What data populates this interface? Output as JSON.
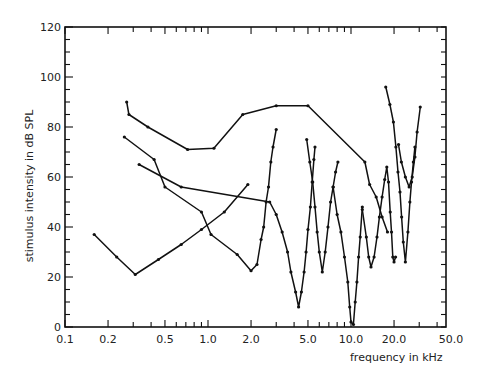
{
  "chart_data": {
    "type": "line",
    "title": "",
    "xlabel": "frequency in kHz",
    "ylabel": "stimulus intensity in dB SPL",
    "xscale": "log",
    "xlim": [
      0.1,
      50.0
    ],
    "ylim": [
      0,
      120
    ],
    "x_ticks": [
      0.1,
      0.2,
      0.5,
      1.0,
      2.0,
      5.0,
      10.0,
      20.0,
      50.0
    ],
    "x_tick_labels": [
      "0.1",
      "0.2",
      "0.5",
      "1.0",
      "2.0",
      "5.0",
      "10.0",
      "20.0",
      "50.0"
    ],
    "y_ticks": [
      0,
      20,
      40,
      60,
      80,
      100,
      120
    ],
    "y_tick_labels": [
      "0",
      "20",
      "40",
      "60",
      "80",
      "100",
      "120"
    ],
    "grid": false,
    "legend": null,
    "series": [
      {
        "name": "curve-1",
        "points": [
          [
            0.27,
            90
          ],
          [
            0.28,
            85
          ],
          [
            0.38,
            80
          ],
          [
            0.72,
            71
          ],
          [
            1.1,
            71.5
          ],
          [
            1.75,
            85
          ],
          [
            3.0,
            88.5
          ],
          [
            5.0,
            88.5
          ],
          [
            12.5,
            66
          ],
          [
            13.5,
            57
          ],
          [
            15.0,
            52
          ],
          [
            16.5,
            44
          ],
          [
            18.0,
            38
          ]
        ]
      },
      {
        "name": "curve-2",
        "points": [
          [
            0.26,
            76
          ],
          [
            0.42,
            67
          ],
          [
            0.5,
            56
          ],
          [
            0.9,
            46
          ],
          [
            1.05,
            37
          ],
          [
            1.6,
            29
          ],
          [
            2.0,
            22.5
          ],
          [
            2.2,
            25
          ],
          [
            2.35,
            35
          ],
          [
            2.45,
            40
          ],
          [
            2.55,
            50
          ],
          [
            2.65,
            56
          ],
          [
            2.75,
            66
          ],
          [
            2.85,
            72
          ],
          [
            3.0,
            79
          ]
        ]
      },
      {
        "name": "curve-3",
        "points": [
          [
            0.33,
            65
          ],
          [
            0.65,
            56
          ],
          [
            2.7,
            50
          ],
          [
            3.0,
            45
          ],
          [
            3.3,
            38
          ],
          [
            3.6,
            30
          ],
          [
            3.8,
            22
          ],
          [
            4.1,
            14
          ],
          [
            4.3,
            8
          ],
          [
            4.5,
            14
          ],
          [
            4.7,
            22
          ],
          [
            4.85,
            30
          ],
          [
            5.0,
            39
          ],
          [
            5.2,
            48
          ],
          [
            5.35,
            58
          ],
          [
            5.5,
            67
          ],
          [
            5.6,
            72
          ]
        ]
      },
      {
        "name": "curve-4",
        "points": [
          [
            0.16,
            37
          ],
          [
            0.23,
            28
          ],
          [
            0.31,
            21
          ],
          [
            0.45,
            27
          ],
          [
            0.65,
            33
          ],
          [
            0.9,
            39
          ],
          [
            1.3,
            46
          ],
          [
            1.9,
            57
          ]
        ]
      },
      {
        "name": "curve-5",
        "points": [
          [
            4.9,
            75
          ],
          [
            5.15,
            66
          ],
          [
            5.4,
            58
          ],
          [
            5.6,
            48
          ],
          [
            5.8,
            38
          ],
          [
            6.0,
            30
          ],
          [
            6.3,
            22
          ],
          [
            6.6,
            30
          ],
          [
            6.9,
            40
          ],
          [
            7.2,
            50
          ],
          [
            7.5,
            56
          ],
          [
            7.8,
            62
          ],
          [
            8.1,
            66
          ]
        ]
      },
      {
        "name": "curve-6",
        "points": [
          [
            7.5,
            56
          ],
          [
            8.0,
            45
          ],
          [
            8.5,
            38
          ],
          [
            9.0,
            28
          ],
          [
            9.5,
            18
          ],
          [
            9.8,
            8
          ],
          [
            10.0,
            2
          ],
          [
            10.4,
            1
          ],
          [
            10.7,
            10
          ],
          [
            11.0,
            18
          ],
          [
            11.3,
            28
          ],
          [
            11.6,
            36
          ],
          [
            12.0,
            48
          ]
        ]
      },
      {
        "name": "curve-7",
        "points": [
          [
            12.0,
            47
          ],
          [
            12.8,
            36
          ],
          [
            13.3,
            28
          ],
          [
            13.8,
            24
          ],
          [
            14.5,
            28
          ],
          [
            15.2,
            36
          ],
          [
            15.8,
            44
          ],
          [
            16.5,
            52
          ],
          [
            17.2,
            59
          ],
          [
            17.8,
            64
          ],
          [
            18.3,
            58
          ],
          [
            18.8,
            46
          ],
          [
            19.2,
            38
          ],
          [
            19.6,
            28
          ],
          [
            20.0,
            26
          ],
          [
            20.5,
            28
          ]
        ]
      },
      {
        "name": "curve-8",
        "points": [
          [
            17.5,
            96
          ],
          [
            18.7,
            89
          ],
          [
            19.8,
            82
          ],
          [
            20.6,
            72
          ],
          [
            21.3,
            62
          ],
          [
            22.0,
            54
          ],
          [
            22.6,
            44
          ],
          [
            23.2,
            34
          ],
          [
            24.0,
            26
          ],
          [
            25.0,
            38
          ],
          [
            25.8,
            50
          ],
          [
            26.5,
            58
          ],
          [
            27.3,
            66
          ],
          [
            28.0,
            72
          ]
        ]
      },
      {
        "name": "curve-9",
        "points": [
          [
            21.5,
            73
          ],
          [
            22.5,
            66
          ],
          [
            24.0,
            60
          ],
          [
            25.5,
            56
          ],
          [
            26.8,
            60
          ],
          [
            28.0,
            68
          ],
          [
            29.0,
            78
          ],
          [
            30.5,
            88
          ]
        ]
      }
    ]
  }
}
